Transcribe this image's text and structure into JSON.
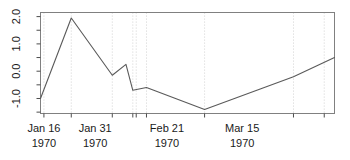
{
  "chart_data": {
    "type": "line",
    "title": "",
    "xlabel": "",
    "ylabel": "",
    "ylim": [
      -1.55,
      2.15
    ],
    "yticks": [
      -1.0,
      0.0,
      1.0,
      2.0
    ],
    "ytick_labels": [
      "-1.0",
      "0.0",
      "1.0",
      "2.0"
    ],
    "y_minor_ticks": [
      -1.5,
      -0.5,
      0.5,
      1.5
    ],
    "grid": "vertical-dotted",
    "legend": "none",
    "xtick_labels": [
      {
        "date": "Jan 16",
        "year": "1970"
      },
      {
        "date": "Jan 31",
        "year": "1970"
      },
      {
        "date": "Feb 21",
        "year": "1970"
      },
      {
        "date": "Mar 15",
        "year": "1970"
      }
    ],
    "xtick_label_positions": [
      1,
      16,
      37,
      59
    ],
    "x_axis_tick_positions": [
      1,
      9,
      21,
      27,
      28,
      31,
      48,
      74,
      83
    ],
    "gridline_positions": [
      1,
      9,
      21,
      27,
      28,
      31,
      48,
      74,
      83
    ],
    "x": [
      0,
      9,
      21,
      25,
      27,
      28,
      31,
      48,
      74,
      86
    ],
    "y": [
      -1.0,
      1.95,
      -0.15,
      0.25,
      -0.7,
      -0.6,
      -0.85,
      -1.4,
      -0.2,
      0.5
    ],
    "series": [
      {
        "name": "value",
        "points": [
          {
            "x": 0,
            "y": -1.0
          },
          {
            "x": 9,
            "y": 1.95
          },
          {
            "x": 21,
            "y": -0.15
          },
          {
            "x": 25,
            "y": 0.25
          },
          {
            "x": 27,
            "y": -0.7
          },
          {
            "x": 31,
            "y": -0.6
          },
          {
            "x": 48,
            "y": -1.4
          },
          {
            "x": 74,
            "y": -0.2
          },
          {
            "x": 86,
            "y": 0.5
          }
        ]
      }
    ],
    "xlim": [
      0,
      86
    ],
    "colors": {
      "line": "#5a5a5a",
      "frame": "#808080",
      "grid": "#d9d9d9",
      "text": "#1a1a1a",
      "background": "#ffffff"
    }
  }
}
